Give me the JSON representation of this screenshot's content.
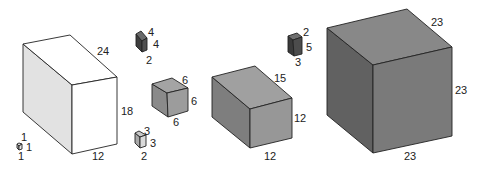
{
  "diagram": {
    "boxes": [
      {
        "id": "box-1x1x1",
        "dimensions": [
          1,
          1,
          1
        ],
        "colors": {
          "top": "#d8d8d8",
          "left": "#b8b8b8",
          "front": "#e6e6e6"
        },
        "vertices": {
          "tl": [
            17,
            144
          ],
          "tb": [
            19,
            143
          ],
          "tr": [
            22,
            144
          ],
          "ftl": [
            19,
            146
          ],
          "bf": [
            19,
            150
          ],
          "br": [
            22,
            149
          ],
          "bl": [
            17,
            148
          ]
        },
        "labels": [
          {
            "text": "1",
            "x": 21,
            "y": 141
          },
          {
            "text": "1",
            "x": 26,
            "y": 151
          },
          {
            "text": "1",
            "x": 18,
            "y": 160
          }
        ]
      },
      {
        "id": "box-12x18x24",
        "dimensions": [
          12,
          18,
          24
        ],
        "colors": {
          "top": "#ffffff",
          "left": "#e2e2e2",
          "front": "#ffffff"
        },
        "vertices": {
          "tl": [
            23,
            44
          ],
          "tb": [
            70,
            35
          ],
          "tr": [
            117,
            77
          ],
          "ftl": [
            72,
            85
          ],
          "bf": [
            72,
            154
          ],
          "br": [
            117,
            144
          ],
          "bl": [
            23,
            112
          ]
        },
        "labels": [
          {
            "text": "24",
            "x": 97,
            "y": 55
          },
          {
            "text": "18",
            "x": 121,
            "y": 115
          },
          {
            "text": "12",
            "x": 92,
            "y": 160
          }
        ]
      },
      {
        "id": "box-2x4x4",
        "dimensions": [
          2,
          4,
          4
        ],
        "colors": {
          "top": "#6a6a6a",
          "left": "#3e3e3e",
          "front": "#505050"
        },
        "vertices": {
          "tl": [
            136,
            34
          ],
          "tb": [
            141,
            31
          ],
          "tr": [
            147,
            38
          ],
          "ftl": [
            142,
            41
          ],
          "bf": [
            142,
            52
          ],
          "br": [
            147,
            50
          ],
          "bl": [
            136,
            46
          ]
        },
        "labels": [
          {
            "text": "4",
            "x": 148,
            "y": 36
          },
          {
            "text": "4",
            "x": 153,
            "y": 48
          },
          {
            "text": "2",
            "x": 146,
            "y": 64
          }
        ]
      },
      {
        "id": "box-6x6x6",
        "dimensions": [
          6,
          6,
          6
        ],
        "colors": {
          "top": "#a4a4a4",
          "left": "#8a8a8a",
          "front": "#9c9c9c"
        },
        "vertices": {
          "tl": [
            152,
            84
          ],
          "tb": [
            172,
            78
          ],
          "tr": [
            188,
            88
          ],
          "ftl": [
            167,
            93
          ],
          "bf": [
            168,
            117
          ],
          "br": [
            188,
            111
          ],
          "bl": [
            152,
            106
          ]
        },
        "labels": [
          {
            "text": "6",
            "x": 182,
            "y": 84
          },
          {
            "text": "6",
            "x": 191,
            "y": 105
          },
          {
            "text": "6",
            "x": 173,
            "y": 126
          }
        ]
      },
      {
        "id": "box-2x3x3",
        "dimensions": [
          2,
          3,
          3
        ],
        "colors": {
          "top": "#c8c8c8",
          "left": "#a8a8a8",
          "front": "#dadada"
        },
        "vertices": {
          "tl": [
            135,
            133
          ],
          "tb": [
            139,
            131
          ],
          "tr": [
            146,
            135
          ],
          "ftl": [
            140,
            137
          ],
          "bf": [
            140,
            148
          ],
          "br": [
            146,
            146
          ],
          "bl": [
            135,
            143
          ]
        },
        "labels": [
          {
            "text": "3",
            "x": 144,
            "y": 135
          },
          {
            "text": "3",
            "x": 150,
            "y": 147
          },
          {
            "text": "2",
            "x": 141,
            "y": 160
          }
        ]
      },
      {
        "id": "box-12x12x15",
        "dimensions": [
          12,
          12,
          15
        ],
        "colors": {
          "top": "#a0a0a0",
          "left": "#7e7e7e",
          "front": "#979797"
        },
        "vertices": {
          "tl": [
            212,
            77
          ],
          "tb": [
            255,
            66
          ],
          "tr": [
            292,
            98
          ],
          "ftl": [
            250,
            109
          ],
          "bf": [
            250,
            148
          ],
          "br": [
            292,
            138
          ],
          "bl": [
            212,
            117
          ]
        },
        "labels": [
          {
            "text": "15",
            "x": 274,
            "y": 82
          },
          {
            "text": "12",
            "x": 294,
            "y": 122
          },
          {
            "text": "12",
            "x": 264,
            "y": 160
          }
        ]
      },
      {
        "id": "box-2x3x5",
        "dimensions": [
          2,
          3,
          5
        ],
        "colors": {
          "top": "#6e6e6e",
          "left": "#3a3a3a",
          "front": "#4c4c4c"
        },
        "vertices": {
          "tl": [
            288,
            36
          ],
          "tb": [
            297,
            33
          ],
          "tr": [
            302,
            37
          ],
          "ftl": [
            293,
            40
          ],
          "bf": [
            294,
            56
          ],
          "br": [
            302,
            54
          ],
          "bl": [
            288,
            52
          ]
        },
        "labels": [
          {
            "text": "2",
            "x": 303,
            "y": 36
          },
          {
            "text": "5",
            "x": 306,
            "y": 51
          },
          {
            "text": "3",
            "x": 295,
            "y": 66
          }
        ]
      },
      {
        "id": "box-23x23x23",
        "dimensions": [
          23,
          23,
          23
        ],
        "colors": {
          "top": "#888888",
          "left": "#616161",
          "front": "#7a7a7a"
        },
        "vertices": {
          "tl": [
            327,
            28
          ],
          "tb": [
            407,
            9
          ],
          "tr": [
            452,
            47
          ],
          "ftl": [
            373,
            65
          ],
          "bf": [
            373,
            153
          ],
          "br": [
            452,
            136
          ],
          "bl": [
            327,
            115
          ]
        },
        "labels": [
          {
            "text": "23",
            "x": 431,
            "y": 26
          },
          {
            "text": "23",
            "x": 455,
            "y": 94
          },
          {
            "text": "23",
            "x": 404,
            "y": 160
          }
        ]
      }
    ]
  }
}
